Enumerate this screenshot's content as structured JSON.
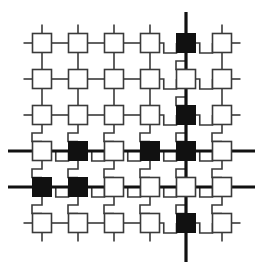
{
  "figure": {
    "background_color": "#ffffff",
    "line_color": "#3a3a3a",
    "bus_color": "#111111",
    "node_fill_light": "#ffffff",
    "node_fill_dark": "#111111",
    "node_stroke": "#3a3a3a",
    "width": 263,
    "height": 270
  },
  "grid": {
    "rows": 6,
    "cols": 6,
    "col_centers": [
      42,
      78,
      114,
      150,
      186,
      222
    ],
    "row_centers": [
      43,
      79,
      115,
      151,
      187,
      223
    ],
    "node_size": 19,
    "thin_stroke": 1.6,
    "bus_stroke": 3.2
  },
  "nodes": [
    {
      "id": "n-r1c1",
      "row": 1,
      "col": 1,
      "state": "light"
    },
    {
      "id": "n-r1c2",
      "row": 1,
      "col": 2,
      "state": "light"
    },
    {
      "id": "n-r1c3",
      "row": 1,
      "col": 3,
      "state": "light"
    },
    {
      "id": "n-r1c4",
      "row": 1,
      "col": 4,
      "state": "light"
    },
    {
      "id": "n-r1c5",
      "row": 1,
      "col": 5,
      "state": "dark"
    },
    {
      "id": "n-r1c6",
      "row": 1,
      "col": 6,
      "state": "light"
    },
    {
      "id": "n-r2c1",
      "row": 2,
      "col": 1,
      "state": "light"
    },
    {
      "id": "n-r2c2",
      "row": 2,
      "col": 2,
      "state": "light"
    },
    {
      "id": "n-r2c3",
      "row": 2,
      "col": 3,
      "state": "light"
    },
    {
      "id": "n-r2c4",
      "row": 2,
      "col": 4,
      "state": "light"
    },
    {
      "id": "n-r2c5",
      "row": 2,
      "col": 5,
      "state": "light"
    },
    {
      "id": "n-r2c6",
      "row": 2,
      "col": 6,
      "state": "light"
    },
    {
      "id": "n-r3c1",
      "row": 3,
      "col": 1,
      "state": "light"
    },
    {
      "id": "n-r3c2",
      "row": 3,
      "col": 2,
      "state": "light"
    },
    {
      "id": "n-r3c3",
      "row": 3,
      "col": 3,
      "state": "light"
    },
    {
      "id": "n-r3c4",
      "row": 3,
      "col": 4,
      "state": "light"
    },
    {
      "id": "n-r3c5",
      "row": 3,
      "col": 5,
      "state": "dark"
    },
    {
      "id": "n-r3c6",
      "row": 3,
      "col": 6,
      "state": "light"
    },
    {
      "id": "n-r4c1",
      "row": 4,
      "col": 1,
      "state": "light"
    },
    {
      "id": "n-r4c2",
      "row": 4,
      "col": 2,
      "state": "dark"
    },
    {
      "id": "n-r4c3",
      "row": 4,
      "col": 3,
      "state": "light"
    },
    {
      "id": "n-r4c4",
      "row": 4,
      "col": 4,
      "state": "dark"
    },
    {
      "id": "n-r4c5",
      "row": 4,
      "col": 5,
      "state": "dark"
    },
    {
      "id": "n-r4c6",
      "row": 4,
      "col": 6,
      "state": "light"
    },
    {
      "id": "n-r5c1",
      "row": 5,
      "col": 1,
      "state": "dark"
    },
    {
      "id": "n-r5c2",
      "row": 5,
      "col": 2,
      "state": "dark"
    },
    {
      "id": "n-r5c3",
      "row": 5,
      "col": 3,
      "state": "light"
    },
    {
      "id": "n-r5c4",
      "row": 5,
      "col": 4,
      "state": "light"
    },
    {
      "id": "n-r5c5",
      "row": 5,
      "col": 5,
      "state": "light"
    },
    {
      "id": "n-r5c6",
      "row": 5,
      "col": 6,
      "state": "light"
    },
    {
      "id": "n-r6c1",
      "row": 6,
      "col": 1,
      "state": "light"
    },
    {
      "id": "n-r6c2",
      "row": 6,
      "col": 2,
      "state": "light"
    },
    {
      "id": "n-r6c3",
      "row": 6,
      "col": 3,
      "state": "light"
    },
    {
      "id": "n-r6c4",
      "row": 6,
      "col": 4,
      "state": "light"
    },
    {
      "id": "n-r6c5",
      "row": 6,
      "col": 5,
      "state": "dark"
    },
    {
      "id": "n-r6c6",
      "row": 6,
      "col": 6,
      "state": "light"
    }
  ],
  "buses": [
    {
      "id": "bus-col5",
      "orientation": "vertical",
      "index": 5,
      "from": 12,
      "to": 262
    },
    {
      "id": "bus-row4",
      "orientation": "horizontal",
      "index": 4,
      "from": 8,
      "to": 255
    },
    {
      "id": "bus-row5",
      "orientation": "horizontal",
      "index": 5,
      "from": 8,
      "to": 255
    }
  ],
  "horizontal_links": [
    {
      "row": 1,
      "from_col": 0,
      "to_col": 1,
      "style": "straight"
    },
    {
      "row": 1,
      "from_col": 1,
      "to_col": 2,
      "style": "straight"
    },
    {
      "row": 1,
      "from_col": 2,
      "to_col": 3,
      "style": "straight"
    },
    {
      "row": 1,
      "from_col": 3,
      "to_col": 4,
      "style": "straight"
    },
    {
      "row": 1,
      "from_col": 4,
      "to_col": 5,
      "style": "step-down"
    },
    {
      "row": 1,
      "from_col": 5,
      "to_col": 6,
      "style": "step-down"
    },
    {
      "row": 1,
      "from_col": 6,
      "to_col": 7,
      "style": "straight"
    },
    {
      "row": 2,
      "from_col": 0,
      "to_col": 1,
      "style": "straight"
    },
    {
      "row": 2,
      "from_col": 1,
      "to_col": 2,
      "style": "straight"
    },
    {
      "row": 2,
      "from_col": 2,
      "to_col": 3,
      "style": "straight"
    },
    {
      "row": 2,
      "from_col": 3,
      "to_col": 4,
      "style": "straight"
    },
    {
      "row": 2,
      "from_col": 4,
      "to_col": 5,
      "style": "step-down"
    },
    {
      "row": 2,
      "from_col": 5,
      "to_col": 6,
      "style": "step-down"
    },
    {
      "row": 2,
      "from_col": 6,
      "to_col": 7,
      "style": "straight"
    },
    {
      "row": 3,
      "from_col": 0,
      "to_col": 1,
      "style": "straight"
    },
    {
      "row": 3,
      "from_col": 1,
      "to_col": 2,
      "style": "straight"
    },
    {
      "row": 3,
      "from_col": 2,
      "to_col": 3,
      "style": "straight"
    },
    {
      "row": 3,
      "from_col": 3,
      "to_col": 4,
      "style": "straight"
    },
    {
      "row": 3,
      "from_col": 4,
      "to_col": 5,
      "style": "step-down"
    },
    {
      "row": 3,
      "from_col": 5,
      "to_col": 6,
      "style": "step-down"
    },
    {
      "row": 3,
      "from_col": 6,
      "to_col": 7,
      "style": "straight"
    },
    {
      "row": 4,
      "from_col": 0,
      "to_col": 1,
      "style": "step-down"
    },
    {
      "row": 4,
      "from_col": 1,
      "to_col": 2,
      "style": "step-down"
    },
    {
      "row": 4,
      "from_col": 2,
      "to_col": 3,
      "style": "step-down"
    },
    {
      "row": 4,
      "from_col": 3,
      "to_col": 4,
      "style": "step-down"
    },
    {
      "row": 4,
      "from_col": 4,
      "to_col": 5,
      "style": "step-down"
    },
    {
      "row": 4,
      "from_col": 5,
      "to_col": 6,
      "style": "step-down"
    },
    {
      "row": 5,
      "from_col": 0,
      "to_col": 1,
      "style": "step-down"
    },
    {
      "row": 5,
      "from_col": 1,
      "to_col": 2,
      "style": "step-down"
    },
    {
      "row": 5,
      "from_col": 2,
      "to_col": 3,
      "style": "step-down"
    },
    {
      "row": 5,
      "from_col": 3,
      "to_col": 4,
      "style": "step-down"
    },
    {
      "row": 5,
      "from_col": 4,
      "to_col": 5,
      "style": "step-down"
    },
    {
      "row": 5,
      "from_col": 5,
      "to_col": 6,
      "style": "step-down"
    },
    {
      "row": 6,
      "from_col": 0,
      "to_col": 1,
      "style": "straight"
    },
    {
      "row": 6,
      "from_col": 1,
      "to_col": 2,
      "style": "straight"
    },
    {
      "row": 6,
      "from_col": 2,
      "to_col": 3,
      "style": "straight"
    },
    {
      "row": 6,
      "from_col": 3,
      "to_col": 4,
      "style": "straight"
    },
    {
      "row": 6,
      "from_col": 4,
      "to_col": 5,
      "style": "step-down"
    },
    {
      "row": 6,
      "from_col": 5,
      "to_col": 6,
      "style": "step-down"
    },
    {
      "row": 6,
      "from_col": 6,
      "to_col": 7,
      "style": "straight"
    }
  ],
  "vertical_links": [
    {
      "col": 1,
      "from_row": 0,
      "to_row": 1,
      "style": "straight"
    },
    {
      "col": 1,
      "from_row": 1,
      "to_row": 2,
      "style": "straight"
    },
    {
      "col": 1,
      "from_row": 2,
      "to_row": 3,
      "style": "straight"
    },
    {
      "col": 1,
      "from_row": 3,
      "to_row": 4,
      "style": "step-right"
    },
    {
      "col": 1,
      "from_row": 4,
      "to_row": 5,
      "style": "step-right"
    },
    {
      "col": 1,
      "from_row": 5,
      "to_row": 6,
      "style": "step-right"
    },
    {
      "col": 1,
      "from_row": 6,
      "to_row": 7,
      "style": "straight"
    },
    {
      "col": 2,
      "from_row": 0,
      "to_row": 1,
      "style": "straight"
    },
    {
      "col": 2,
      "from_row": 1,
      "to_row": 2,
      "style": "straight"
    },
    {
      "col": 2,
      "from_row": 2,
      "to_row": 3,
      "style": "straight"
    },
    {
      "col": 2,
      "from_row": 3,
      "to_row": 4,
      "style": "step-right"
    },
    {
      "col": 2,
      "from_row": 4,
      "to_row": 5,
      "style": "step-right"
    },
    {
      "col": 2,
      "from_row": 5,
      "to_row": 6,
      "style": "step-right"
    },
    {
      "col": 2,
      "from_row": 6,
      "to_row": 7,
      "style": "straight"
    },
    {
      "col": 3,
      "from_row": 0,
      "to_row": 1,
      "style": "straight"
    },
    {
      "col": 3,
      "from_row": 1,
      "to_row": 2,
      "style": "straight"
    },
    {
      "col": 3,
      "from_row": 2,
      "to_row": 3,
      "style": "straight"
    },
    {
      "col": 3,
      "from_row": 3,
      "to_row": 4,
      "style": "step-right"
    },
    {
      "col": 3,
      "from_row": 4,
      "to_row": 5,
      "style": "step-right"
    },
    {
      "col": 3,
      "from_row": 5,
      "to_row": 6,
      "style": "step-right"
    },
    {
      "col": 3,
      "from_row": 6,
      "to_row": 7,
      "style": "straight"
    },
    {
      "col": 4,
      "from_row": 0,
      "to_row": 1,
      "style": "straight"
    },
    {
      "col": 4,
      "from_row": 1,
      "to_row": 2,
      "style": "straight"
    },
    {
      "col": 4,
      "from_row": 2,
      "to_row": 3,
      "style": "straight"
    },
    {
      "col": 4,
      "from_row": 3,
      "to_row": 4,
      "style": "step-right"
    },
    {
      "col": 4,
      "from_row": 4,
      "to_row": 5,
      "style": "step-right"
    },
    {
      "col": 4,
      "from_row": 5,
      "to_row": 6,
      "style": "step-right"
    },
    {
      "col": 4,
      "from_row": 6,
      "to_row": 7,
      "style": "straight"
    },
    {
      "col": 5,
      "from_row": 1,
      "to_row": 2,
      "style": "step-right"
    },
    {
      "col": 5,
      "from_row": 2,
      "to_row": 3,
      "style": "step-right"
    },
    {
      "col": 5,
      "from_row": 3,
      "to_row": 4,
      "style": "step-right"
    },
    {
      "col": 5,
      "from_row": 4,
      "to_row": 5,
      "style": "step-right"
    },
    {
      "col": 5,
      "from_row": 5,
      "to_row": 6,
      "style": "step-right"
    },
    {
      "col": 6,
      "from_row": 0,
      "to_row": 1,
      "style": "straight"
    },
    {
      "col": 6,
      "from_row": 1,
      "to_row": 2,
      "style": "straight"
    },
    {
      "col": 6,
      "from_row": 2,
      "to_row": 3,
      "style": "straight"
    },
    {
      "col": 6,
      "from_row": 3,
      "to_row": 4,
      "style": "step-right"
    },
    {
      "col": 6,
      "from_row": 4,
      "to_row": 5,
      "style": "step-right"
    },
    {
      "col": 6,
      "from_row": 5,
      "to_row": 6,
      "style": "step-right"
    },
    {
      "col": 6,
      "from_row": 6,
      "to_row": 7,
      "style": "straight"
    }
  ]
}
